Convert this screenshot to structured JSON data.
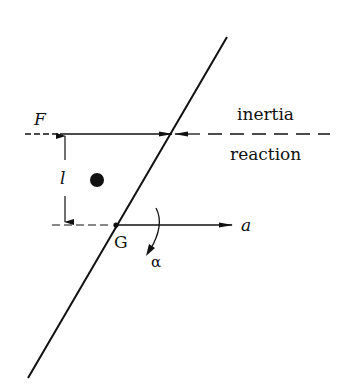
{
  "diagram": {
    "type": "free-body diagram",
    "labels": {
      "force": "F",
      "inertia_line1": "inertia",
      "inertia_line2": "reaction",
      "distance": "l",
      "center_of_gravity": "G",
      "acceleration": "a",
      "angular_acceleration": "α"
    },
    "colors": {
      "ink": "#111111",
      "background": "#ffffff"
    }
  }
}
